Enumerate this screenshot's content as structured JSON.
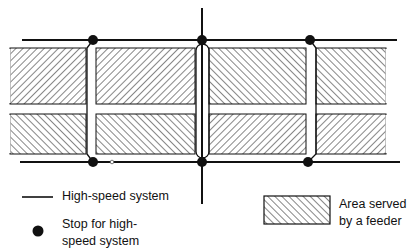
{
  "diagram": {
    "type": "transit-network-schematic",
    "colors": {
      "line": "#111111",
      "hatch": "#222222",
      "background": "#ffffff"
    },
    "high_speed_lines": [
      "top-horizontal",
      "bottom-horizontal",
      "central-vertical"
    ],
    "stops_count": 6,
    "feeder_areas_count": 8
  },
  "legend": {
    "high_speed_system": {
      "icon": "line-segment",
      "label": "High-speed system"
    },
    "stop": {
      "icon": "filled-dot",
      "label_line1": "Stop for high-",
      "label_line2": "speed system"
    },
    "feeder_area": {
      "icon": "hatched-rectangle",
      "label_line1": "Area served",
      "label_line2": "by a feeder"
    }
  }
}
